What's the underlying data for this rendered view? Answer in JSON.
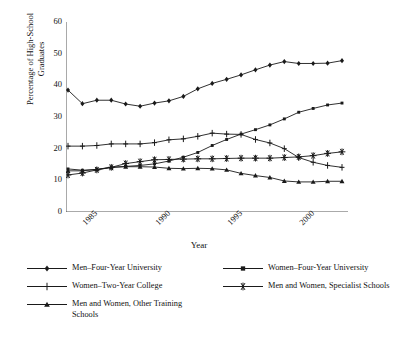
{
  "chart_data": {
    "type": "line",
    "title": "",
    "xlabel": "Year",
    "ylabel": "Percentage of High-School Graduates",
    "ylabel_line1": "Percentage of High-School",
    "ylabel_line2": "Graduates",
    "ylim": [
      0,
      60
    ],
    "yticks": [
      0,
      10,
      20,
      30,
      40,
      50,
      60
    ],
    "xlim": [
      1984,
      2003
    ],
    "x": [
      1984,
      1985,
      1986,
      1987,
      1988,
      1989,
      1990,
      1991,
      1992,
      1993,
      1994,
      1995,
      1996,
      1997,
      1998,
      1999,
      2000,
      2001,
      2002,
      2003
    ],
    "xticks": [
      1985,
      1990,
      1995,
      2000
    ],
    "xticklabels": [
      "1985",
      "1990",
      "1995",
      "2000"
    ],
    "grid": false,
    "legend_position": "below",
    "series": [
      {
        "name": "Men–Four-Year University",
        "marker": "diamond",
        "values": [
          38.5,
          34.2,
          35.3,
          35.3,
          34.1,
          33.4,
          34.4,
          35.1,
          36.5,
          38.9,
          40.6,
          41.9,
          43.3,
          44.9,
          46.4,
          47.5,
          46.9,
          46.9,
          47.0,
          47.8
        ]
      },
      {
        "name": "Women–Four-Year University",
        "marker": "square",
        "values": [
          13.6,
          13.2,
          13.4,
          14.1,
          14.4,
          14.7,
          15.2,
          16.1,
          17.3,
          18.8,
          21.0,
          22.9,
          24.6,
          26.0,
          27.5,
          29.4,
          31.5,
          32.7,
          33.8,
          34.4
        ]
      },
      {
        "name": "Women–Two-Year College",
        "marker": "plus",
        "values": [
          20.8,
          20.8,
          21.0,
          21.5,
          21.5,
          21.5,
          21.9,
          22.8,
          23.1,
          23.9,
          24.9,
          24.6,
          24.5,
          22.9,
          21.8,
          20.0,
          17.2,
          15.7,
          14.7,
          14.1
        ]
      },
      {
        "name": "Men and Women, Specialist Schools",
        "marker": "asterisk",
        "values": [
          11.7,
          12.3,
          13.3,
          14.1,
          15.3,
          15.9,
          16.5,
          16.6,
          16.7,
          16.8,
          16.8,
          16.9,
          17.0,
          17.0,
          17.0,
          17.2,
          17.4,
          17.8,
          18.5,
          19.0
        ]
      },
      {
        "name": "Men and Women, Other Training Schools",
        "marker": "triangle",
        "values": [
          13.0,
          13.0,
          13.5,
          14.1,
          14.3,
          14.3,
          14.2,
          13.8,
          13.7,
          13.8,
          13.7,
          13.3,
          12.2,
          11.5,
          10.9,
          9.8,
          9.5,
          9.5,
          9.7,
          9.7
        ]
      }
    ]
  },
  "legend": {
    "col1": [
      {
        "label": "Men–Four-Year University",
        "marker": "diamond"
      },
      {
        "label": "Women–Two-Year College",
        "marker": "plus"
      },
      {
        "label": "Men and Women, Other Training Schools",
        "marker": "triangle"
      }
    ],
    "col2": [
      {
        "label": "Women–Four-Year University",
        "marker": "square"
      },
      {
        "label": "Men and Women, Specialist Schools",
        "marker": "asterisk"
      }
    ]
  },
  "colors": {
    "line": "#1a1a1a",
    "axis": "#555555",
    "background": "#ffffff"
  }
}
